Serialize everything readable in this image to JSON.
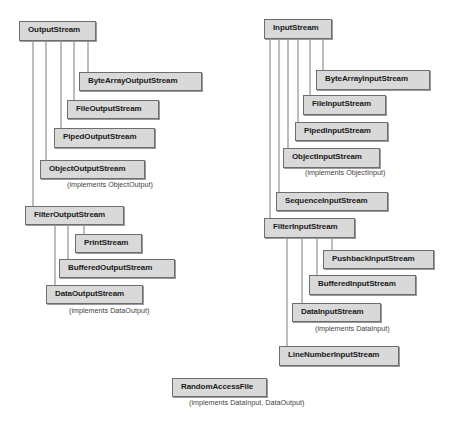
{
  "diagram": {
    "type": "class-hierarchy",
    "output_tree": {
      "root": "OutputStream",
      "children": [
        "ByteArrayOutputStream",
        "FileOutputStream",
        "PipedOutputStream",
        "ObjectOutputStream",
        "FilterOutputStream"
      ],
      "object_output_note": "(implements ObjectOutput)",
      "filter_children": [
        "PrintStream",
        "BufferedOutputStream",
        "DataOutputStream"
      ],
      "data_output_note": "(implements DataOutput)"
    },
    "input_tree": {
      "root": "InputStream",
      "children": [
        "ByteArrayInputStream",
        "FileInputStream",
        "PipedInputStream",
        "ObjectInputStream",
        "SequenceInputStream",
        "FilterInputStream"
      ],
      "object_input_note": "(implements ObjectInput)",
      "filter_children": [
        "PushbackInputStream",
        "BufferedInputStream",
        "DataInputStream",
        "LineNumberInputStream"
      ],
      "data_input_note": "(implements DataInput)"
    },
    "standalone": {
      "name": "RandomAccessFile",
      "note": "(implements DataInput, DataOutput)"
    }
  },
  "colors": {
    "box_fill": "#d9d9d9",
    "box_border": "#6e6e6e",
    "connector": "#7a7a7a",
    "text": "#1a1a1a",
    "note_text": "#444444"
  }
}
